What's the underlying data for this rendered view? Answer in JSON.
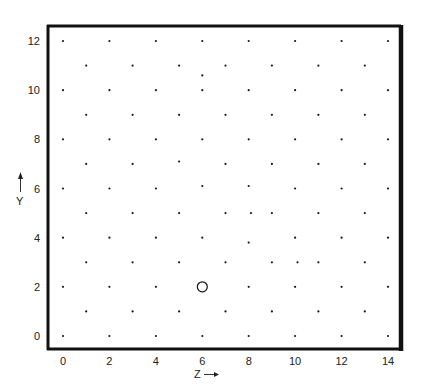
{
  "chart_data": {
    "type": "scatter",
    "title": "",
    "xlabel": "Z",
    "ylabel": "Y",
    "xlim": [
      0,
      14
    ],
    "ylim": [
      0,
      12
    ],
    "grid": false,
    "legend": null,
    "xticks": [
      "0",
      "2",
      "4",
      "6",
      "8",
      "10",
      "12",
      "14"
    ],
    "yticks": [
      "0",
      "2",
      "4",
      "6",
      "8",
      "10",
      "12"
    ],
    "lattice_points": [
      [
        0,
        0
      ],
      [
        2,
        0
      ],
      [
        4,
        0
      ],
      [
        6,
        0
      ],
      [
        8,
        0
      ],
      [
        10,
        0
      ],
      [
        12,
        0
      ],
      [
        14,
        0
      ],
      [
        1,
        1
      ],
      [
        3,
        1
      ],
      [
        5,
        1
      ],
      [
        7,
        1
      ],
      [
        9,
        1
      ],
      [
        11,
        1
      ],
      [
        13,
        1
      ],
      [
        0,
        2
      ],
      [
        2,
        2
      ],
      [
        4,
        2
      ],
      [
        8,
        2
      ],
      [
        10,
        2
      ],
      [
        12,
        2
      ],
      [
        14,
        2
      ],
      [
        1,
        3
      ],
      [
        3,
        3
      ],
      [
        5,
        3
      ],
      [
        7,
        3
      ],
      [
        9,
        3
      ],
      [
        10.1,
        3
      ],
      [
        11,
        3
      ],
      [
        13,
        3
      ],
      [
        0,
        4
      ],
      [
        2,
        4
      ],
      [
        4,
        4
      ],
      [
        6,
        4
      ],
      [
        8,
        3.8
      ],
      [
        10,
        4
      ],
      [
        12,
        4
      ],
      [
        14,
        4
      ],
      [
        1,
        5
      ],
      [
        3,
        5
      ],
      [
        5,
        5
      ],
      [
        7,
        5
      ],
      [
        8.1,
        5
      ],
      [
        9,
        5
      ],
      [
        11,
        5
      ],
      [
        13,
        5
      ],
      [
        0,
        6
      ],
      [
        2,
        6
      ],
      [
        4,
        6
      ],
      [
        6,
        6.1
      ],
      [
        8,
        6.1
      ],
      [
        10,
        6
      ],
      [
        12,
        6
      ],
      [
        14,
        6
      ],
      [
        1,
        7
      ],
      [
        3,
        7
      ],
      [
        5,
        7.1
      ],
      [
        7,
        7
      ],
      [
        9,
        7
      ],
      [
        11,
        7
      ],
      [
        13,
        7
      ],
      [
        0,
        8
      ],
      [
        2,
        8
      ],
      [
        4,
        8
      ],
      [
        6,
        8
      ],
      [
        8,
        8
      ],
      [
        10,
        8
      ],
      [
        12,
        8
      ],
      [
        14,
        8
      ],
      [
        1,
        9
      ],
      [
        3,
        9
      ],
      [
        5,
        9
      ],
      [
        7,
        9
      ],
      [
        9,
        9
      ],
      [
        11,
        9
      ],
      [
        13,
        9
      ],
      [
        0,
        10
      ],
      [
        2,
        10
      ],
      [
        4,
        10
      ],
      [
        6,
        10
      ],
      [
        8,
        10
      ],
      [
        10,
        10
      ],
      [
        12,
        10
      ],
      [
        14,
        10
      ],
      [
        1,
        11
      ],
      [
        3,
        11
      ],
      [
        5,
        11
      ],
      [
        6,
        10.6
      ],
      [
        7,
        11
      ],
      [
        9,
        11
      ],
      [
        11,
        11
      ],
      [
        13,
        11
      ],
      [
        0,
        12
      ],
      [
        2,
        12
      ],
      [
        4,
        12
      ],
      [
        6,
        12
      ],
      [
        8,
        12
      ],
      [
        10,
        12
      ],
      [
        12,
        12
      ],
      [
        14,
        12
      ]
    ],
    "annotations": [
      {
        "type": "open-circle",
        "x": 6,
        "y": 2
      }
    ],
    "axis_arrows": {
      "x": "Z →",
      "y": "Y ↑"
    }
  }
}
